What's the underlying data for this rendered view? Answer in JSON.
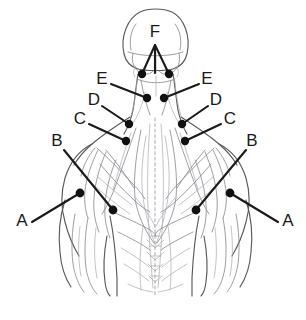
{
  "figure": {
    "view": "posterior",
    "background_color": "#ffffff",
    "line_color": "#5a5a5a",
    "leader_color": "#1a1a1a",
    "marker_color": "#111111"
  },
  "labels": [
    {
      "id": "A-left",
      "text": "A",
      "x": 22,
      "y": 222
    },
    {
      "id": "A-right",
      "text": "A",
      "x": 288,
      "y": 222
    },
    {
      "id": "B-left",
      "text": "B",
      "x": 57,
      "y": 142
    },
    {
      "id": "B-right",
      "text": "B",
      "x": 252,
      "y": 142
    },
    {
      "id": "C-left",
      "text": "C",
      "x": 80,
      "y": 120
    },
    {
      "id": "C-right",
      "text": "C",
      "x": 230,
      "y": 120
    },
    {
      "id": "D-left",
      "text": "D",
      "x": 94,
      "y": 101
    },
    {
      "id": "D-right",
      "text": "D",
      "x": 216,
      "y": 101
    },
    {
      "id": "E-left",
      "text": "E",
      "x": 102,
      "y": 80
    },
    {
      "id": "E-right",
      "text": "E",
      "x": 207,
      "y": 80
    },
    {
      "id": "F-top",
      "text": "F",
      "x": 155,
      "y": 33
    }
  ],
  "leaders": [
    {
      "id": "A-left-leader",
      "label": "A",
      "from_x": 32,
      "from_y": 222,
      "to_x": 80,
      "to_y": 193
    },
    {
      "id": "A-right-leader",
      "label": "A",
      "from_x": 278,
      "from_y": 222,
      "to_x": 230,
      "to_y": 193
    },
    {
      "id": "B-left-leader",
      "label": "B",
      "from_x": 64,
      "from_y": 150,
      "to_x": 113,
      "to_y": 210
    },
    {
      "id": "B-right-leader",
      "label": "B",
      "from_x": 246,
      "from_y": 150,
      "to_x": 196,
      "to_y": 210
    },
    {
      "id": "C-left-leader",
      "label": "C",
      "from_x": 89,
      "from_y": 124,
      "to_x": 126,
      "to_y": 141
    },
    {
      "id": "C-right-leader",
      "label": "C",
      "from_x": 221,
      "from_y": 124,
      "to_x": 185,
      "to_y": 141
    },
    {
      "id": "D-left-leader",
      "label": "D",
      "from_x": 102,
      "from_y": 106,
      "to_x": 129,
      "to_y": 124
    },
    {
      "id": "D-right-leader",
      "label": "D",
      "from_x": 208,
      "from_y": 106,
      "to_x": 182,
      "to_y": 124
    },
    {
      "id": "E-left-leader",
      "label": "E",
      "from_x": 111,
      "from_y": 84,
      "to_x": 147,
      "to_y": 98
    },
    {
      "id": "E-right-leader",
      "label": "E",
      "from_x": 199,
      "from_y": 84,
      "to_x": 164,
      "to_y": 98
    },
    {
      "id": "F-left-leader",
      "label": "F",
      "from_x": 155,
      "from_y": 45,
      "to_x": 142,
      "to_y": 74
    },
    {
      "id": "F-mid-leader",
      "label": "F",
      "from_x": 155,
      "from_y": 45,
      "to_x": 155,
      "to_y": 73
    },
    {
      "id": "F-right-leader",
      "label": "F",
      "from_x": 155,
      "from_y": 45,
      "to_x": 169,
      "to_y": 74
    }
  ],
  "markers": [
    {
      "id": "marker-A-left",
      "label": "A",
      "x": 80,
      "y": 193,
      "r": 4.4
    },
    {
      "id": "marker-A-right",
      "label": "A",
      "x": 230,
      "y": 193,
      "r": 4.4
    },
    {
      "id": "marker-B-left",
      "label": "B",
      "x": 113,
      "y": 210,
      "r": 4.4
    },
    {
      "id": "marker-B-right",
      "label": "B",
      "x": 196,
      "y": 210,
      "r": 4.4
    },
    {
      "id": "marker-C-left",
      "label": "C",
      "x": 126,
      "y": 141,
      "r": 4.2
    },
    {
      "id": "marker-C-right",
      "label": "C",
      "x": 185,
      "y": 141,
      "r": 4.2
    },
    {
      "id": "marker-D-left",
      "label": "D",
      "x": 129,
      "y": 124,
      "r": 4.2
    },
    {
      "id": "marker-D-right",
      "label": "D",
      "x": 182,
      "y": 124,
      "r": 4.2
    },
    {
      "id": "marker-E-left",
      "label": "E",
      "x": 147,
      "y": 98,
      "r": 4.2
    },
    {
      "id": "marker-E-right",
      "label": "E",
      "x": 164,
      "y": 98,
      "r": 4.2
    },
    {
      "id": "marker-F-left",
      "label": "F",
      "x": 142,
      "y": 74,
      "r": 4.2
    },
    {
      "id": "marker-F-right",
      "label": "F",
      "x": 169,
      "y": 74,
      "r": 4.2
    }
  ]
}
